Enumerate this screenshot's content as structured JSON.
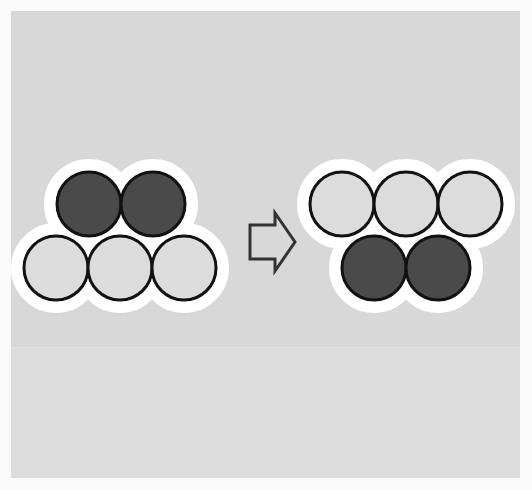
{
  "figure": {
    "title": "Sphere cluster rearrangement",
    "caption": "",
    "canvas": {
      "width": 532,
      "height": 490
    },
    "background": {
      "outer_color": "#fbfbfb",
      "panel_color": "#d8d8d8",
      "panel_band_color": "#dcdcdc",
      "panel": {
        "x": 11,
        "y": 11,
        "width": 509,
        "height": 467
      },
      "band": {
        "x": 0,
        "y": 337,
        "width": 509,
        "height": 130
      }
    },
    "style": {
      "dark_sphere_fill": "#4a4a4a",
      "light_sphere_fill": "#dcdcdc",
      "sphere_outline": "#111111",
      "sphere_outline_width": 3,
      "halo_color": "#ffffff",
      "halo_width": 13,
      "sphere_radius": 32,
      "arrow_outline": "#333333",
      "arrow_fill": "none",
      "arrow_stroke_width": 3
    },
    "clusters": [
      {
        "id": "left-cluster",
        "label": "before",
        "rows": [
          {
            "id": "left-top-row",
            "label": "top row",
            "count": 2,
            "fill": "dark",
            "spheres": [
              {
                "id": "left-top-1",
                "cx": 89,
                "cy": 204,
                "r": 32,
                "fill": "dark"
              },
              {
                "id": "left-top-2",
                "cx": 153,
                "cy": 204,
                "r": 32,
                "fill": "dark"
              }
            ]
          },
          {
            "id": "left-bottom-row",
            "label": "bottom row",
            "count": 3,
            "fill": "light",
            "spheres": [
              {
                "id": "left-bottom-1",
                "cx": 56,
                "cy": 268,
                "r": 32,
                "fill": "light"
              },
              {
                "id": "left-bottom-2",
                "cx": 120,
                "cy": 268,
                "r": 32,
                "fill": "light"
              },
              {
                "id": "left-bottom-3",
                "cx": 184,
                "cy": 268,
                "r": 32,
                "fill": "light"
              }
            ]
          }
        ]
      },
      {
        "id": "right-cluster",
        "label": "after",
        "rows": [
          {
            "id": "right-top-row",
            "label": "top row",
            "count": 3,
            "fill": "light",
            "spheres": [
              {
                "id": "right-top-1",
                "cx": 342,
                "cy": 204,
                "r": 32,
                "fill": "light"
              },
              {
                "id": "right-top-2",
                "cx": 406,
                "cy": 204,
                "r": 32,
                "fill": "light"
              },
              {
                "id": "right-top-3",
                "cx": 470,
                "cy": 204,
                "r": 32,
                "fill": "light"
              }
            ]
          },
          {
            "id": "right-bottom-row",
            "label": "bottom row",
            "count": 2,
            "fill": "dark",
            "spheres": [
              {
                "id": "right-bottom-1",
                "cx": 374,
                "cy": 268,
                "r": 32,
                "fill": "dark"
              },
              {
                "id": "right-bottom-2",
                "cx": 438,
                "cy": 268,
                "r": 32,
                "fill": "dark"
              }
            ]
          }
        ]
      }
    ],
    "arrow": {
      "id": "transformation-arrow",
      "glyph": "rightwards-double-arrow",
      "direction": "right",
      "filled": false,
      "bbox": {
        "x": 249,
        "y": 213,
        "width": 47,
        "height": 58
      },
      "points": "250,225 275,225 275,213 295,242 275,271 275,259 250,259"
    }
  }
}
